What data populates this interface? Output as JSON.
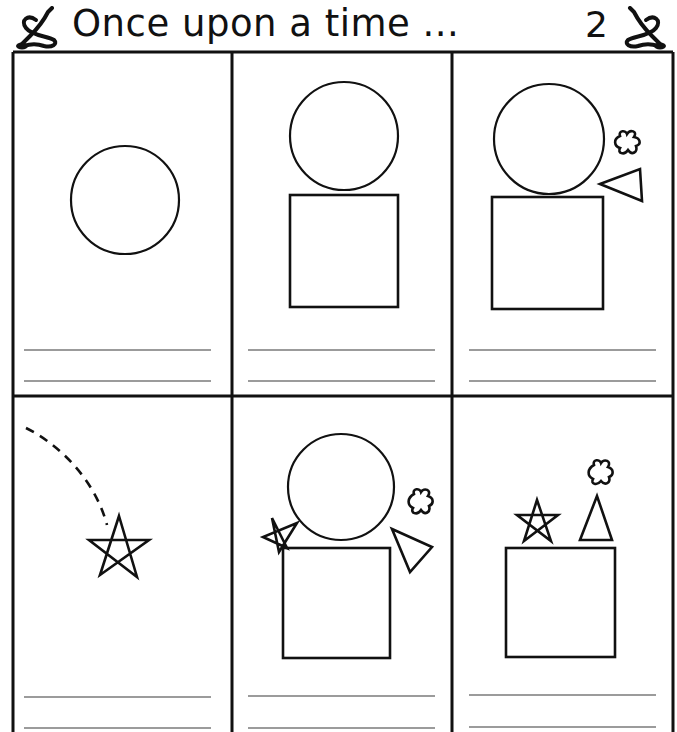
{
  "header": {
    "title": "Once upon a time ...",
    "page_number": "2",
    "left_icon": "ampersand-swash-icon",
    "right_icon": "ampersand-swash-icon"
  },
  "worksheet": {
    "layout": {
      "rows": 2,
      "columns": 3
    },
    "line_color": "#7a7a7a",
    "border_color": "#111111",
    "panels": [
      {
        "index": 1,
        "shapes": [
          "circle"
        ],
        "writing_lines": 2
      },
      {
        "index": 2,
        "shapes": [
          "circle",
          "square"
        ],
        "writing_lines": 2
      },
      {
        "index": 3,
        "shapes": [
          "circle",
          "square",
          "splat",
          "triangle"
        ],
        "writing_lines": 2
      },
      {
        "index": 4,
        "shapes": [
          "dashed-arc",
          "star"
        ],
        "writing_lines": 2
      },
      {
        "index": 5,
        "shapes": [
          "circle",
          "square",
          "star",
          "splat",
          "triangle"
        ],
        "writing_lines": 2
      },
      {
        "index": 6,
        "shapes": [
          "square",
          "star",
          "triangle",
          "splat"
        ],
        "writing_lines": 2
      }
    ]
  }
}
